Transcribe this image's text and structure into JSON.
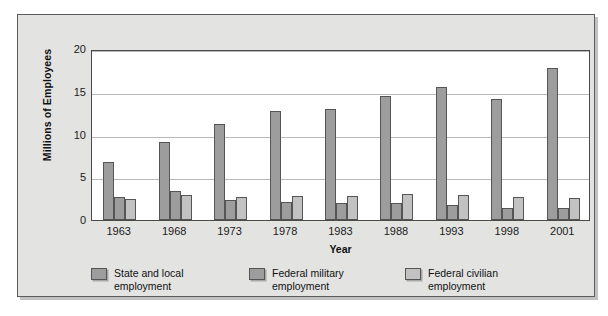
{
  "chart_data": {
    "type": "bar",
    "title": "",
    "xlabel": "Year",
    "ylabel": "Millions of Employees",
    "categories": [
      "1963",
      "1968",
      "1973",
      "1978",
      "1983",
      "1988",
      "1993",
      "1998",
      "2001"
    ],
    "ylim": [
      0,
      20
    ],
    "yticks": [
      "0",
      "5",
      "10",
      "15",
      "20"
    ],
    "ytick_values": [
      0,
      5,
      10,
      15,
      20
    ],
    "grid": true,
    "legend_position": "bottom-left",
    "series": [
      {
        "name": "State and local employment",
        "legend_label": "State and local\nemployment",
        "color": "#9d9d9d",
        "values": [
          6.8,
          9.1,
          11.2,
          12.8,
          13.0,
          14.5,
          15.6,
          14.2,
          17.8
        ]
      },
      {
        "name": "Federal military employment",
        "legend_label": "Federal military\nemployment",
        "color": "#9d9d9d",
        "values": [
          2.7,
          3.4,
          2.3,
          2.1,
          2.0,
          2.0,
          1.7,
          1.4,
          1.4
        ]
      },
      {
        "name": "Federal civilian employment",
        "legend_label": "Federal civilian\nemployment",
        "color": "#c2c2c2",
        "values": [
          2.5,
          2.9,
          2.7,
          2.8,
          2.8,
          3.0,
          2.9,
          2.7,
          2.6
        ]
      }
    ]
  },
  "colors": {
    "panel_background": "#e3e3e1",
    "plot_background": "#ffffff",
    "panel_border": "#5c5c5c",
    "gridline": "#b9b9b9",
    "series_primary": "#9d9d9d",
    "series_light": "#c2c2c2",
    "text": "#111111"
  }
}
